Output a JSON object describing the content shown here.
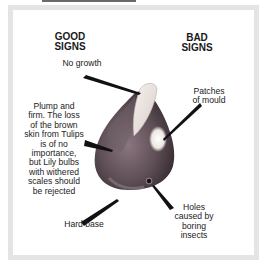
{
  "headings": {
    "good": "GOOD\nSIGNS",
    "good_line1": "GOOD",
    "good_line2": "SIGNS",
    "bad_line1": "BAD",
    "bad_line2": "SIGNS"
  },
  "good_signs": [
    {
      "id": "no-growth",
      "lines": [
        "No growth"
      ]
    },
    {
      "id": "plump-firm",
      "lines": [
        "Plump and",
        "firm. The loss",
        "of the brown",
        "skin from Tulips",
        "is of no",
        "importance,",
        "but Lily bulbs",
        "with withered",
        "scales should",
        "be rejected"
      ]
    },
    {
      "id": "hard-base",
      "lines": [
        "Hard base"
      ]
    }
  ],
  "bad_signs": [
    {
      "id": "patches-mould",
      "lines": [
        "Patches",
        "of mould"
      ]
    },
    {
      "id": "holes-insects",
      "lines": [
        "Holes",
        "caused by",
        "boring",
        "insects"
      ]
    }
  ],
  "colors": {
    "frame": "#e4e4e4",
    "bulb_dark": "#4a3e44",
    "bulb_mid": "#7a6670",
    "skin_light": "#ece6e2",
    "mould": "#f4f2ee",
    "pointer": "#111111"
  }
}
